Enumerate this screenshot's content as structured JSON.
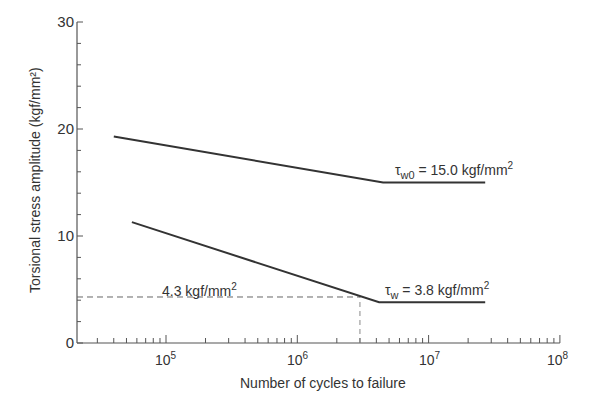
{
  "chart_data": {
    "type": "line",
    "title": "",
    "xlabel": "Number of cycles to failure",
    "ylabel": "Torsional stress amplitude (kgf/mm²)",
    "xscale": "log",
    "xlim": [
      20000,
      100000000
    ],
    "ylim": [
      0,
      30
    ],
    "grid": false,
    "legend": null,
    "y_ticks": [
      "0",
      "10",
      "20",
      "30"
    ],
    "x_ticks": [
      {
        "base": "10",
        "exp": "5"
      },
      {
        "base": "10",
        "exp": "6"
      },
      {
        "base": "10",
        "exp": "7"
      },
      {
        "base": "10",
        "exp": "8"
      }
    ],
    "series": [
      {
        "name": "τw0 (upper S-N curve)",
        "x": [
          40000,
          4500000,
          27000000
        ],
        "y": [
          19.3,
          15.0,
          15.0
        ]
      },
      {
        "name": "τw (lower S-N curve)",
        "x": [
          55000,
          4200000,
          27000000
        ],
        "y": [
          11.3,
          3.8,
          3.8
        ]
      }
    ],
    "reference_lines": [
      {
        "type": "dashed",
        "y": 4.3,
        "x_from": 20000,
        "x_to": 3000000
      },
      {
        "type": "dashed",
        "x": 3000000,
        "y_from": 0,
        "y_to": 4.3
      }
    ],
    "annotations": [
      {
        "text_main": "τ",
        "sub": "w0",
        "rest": " = 15.0 kgf/mm",
        "sup": "2",
        "x": 7000000,
        "y": 15.8
      },
      {
        "text_main": "τ",
        "sub": "w",
        "rest": " = 3.8 kgf/mm",
        "sup": "2",
        "x": 7000000,
        "y": 4.6
      },
      {
        "text_main": "4.3 kgf/mm",
        "sup": "2",
        "x": 150000,
        "y": 5.0
      }
    ]
  }
}
